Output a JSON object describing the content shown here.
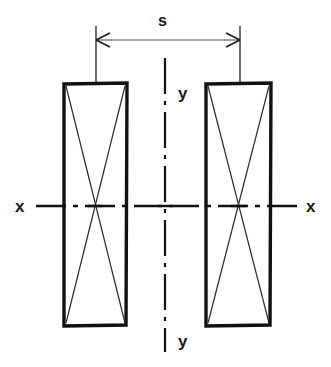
{
  "figure": {
    "background_color": "#ffffff",
    "outline_color": "#111111",
    "thin_line_color": "#333333",
    "axis_color": "#111111",
    "width": 331,
    "height": 367
  },
  "dimension": {
    "label": "s",
    "label_x": 163,
    "label_y": 22,
    "line_y": 40,
    "from_x": 96,
    "to_x": 240,
    "arrow_style": "double-headed",
    "extension_line_top": 26,
    "extension_line_bottom": 84
  },
  "axes": {
    "horizontal": {
      "label_left": "x",
      "label_right": "x",
      "label_left_x": 20,
      "label_right_x": 311,
      "y": 206,
      "start_x": 36,
      "end_x": 297,
      "style": "dash-dot centerline"
    },
    "vertical": {
      "label_top": "y",
      "label_bottom": "y",
      "label_top_x": 184,
      "label_top_y": 94,
      "label_bottom_x": 184,
      "label_bottom_y": 342,
      "x": 165,
      "start_y": 58,
      "end_y": 352,
      "style": "dash-dot centerline"
    }
  },
  "shapes": [
    {
      "name": "left-rectangle",
      "left": 63,
      "top": 83,
      "right": 127,
      "bottom": 326,
      "centroid_x": 95,
      "centroid_y": 206,
      "has_diagonals": true
    },
    {
      "name": "right-rectangle",
      "left": 205,
      "top": 83,
      "right": 271,
      "bottom": 326,
      "centroid_x": 238,
      "centroid_y": 206,
      "has_diagonals": true
    }
  ]
}
